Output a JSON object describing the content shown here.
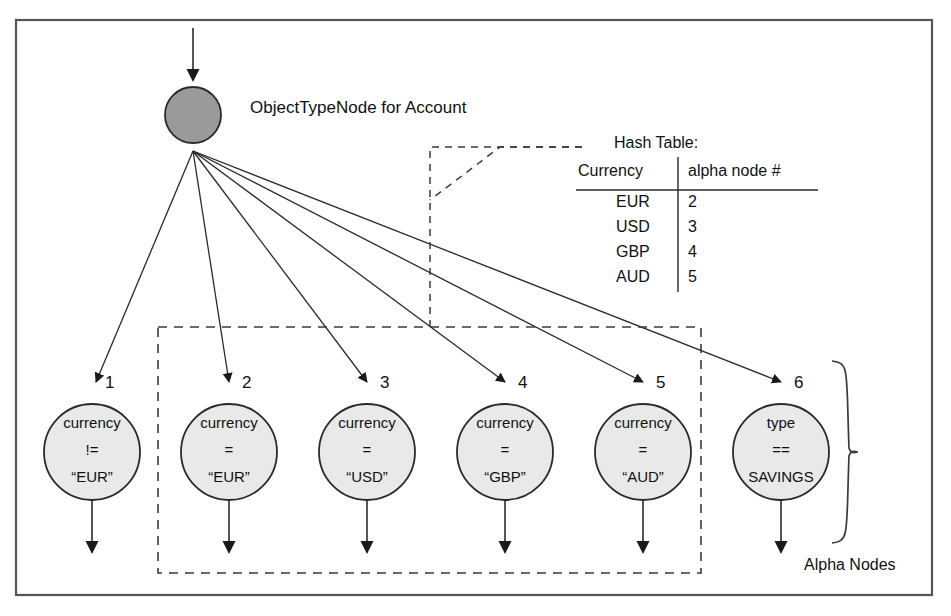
{
  "figure": {
    "title_note": "ObjectTypeNode for Account",
    "root_node": {
      "name": "ObjectTypeNode",
      "label": "ObjectTypeNode for Account",
      "fill": "#9a9a9a"
    }
  },
  "hash_table": {
    "caption": "Hash Table:",
    "columns": [
      "Currency",
      "alpha node #"
    ],
    "rows": [
      {
        "currency": "EUR",
        "node": "2"
      },
      {
        "currency": "USD",
        "node": "3"
      },
      {
        "currency": "GBP",
        "node": "4"
      },
      {
        "currency": "AUD",
        "node": "5"
      }
    ]
  },
  "alpha_nodes": {
    "group_label": "Alpha Nodes",
    "fill": "#e9e9e9",
    "nodes": [
      {
        "number": "1",
        "field": "currency",
        "op": "!=",
        "value": "“EUR”"
      },
      {
        "number": "2",
        "field": "currency",
        "op": "=",
        "value": "“EUR”"
      },
      {
        "number": "3",
        "field": "currency",
        "op": "=",
        "value": "“USD”"
      },
      {
        "number": "4",
        "field": "currency",
        "op": "=",
        "value": "“GBP”"
      },
      {
        "number": "5",
        "field": "currency",
        "op": "=",
        "value": "“AUD”"
      },
      {
        "number": "6",
        "field": "type",
        "op": "==",
        "value": "SAVINGS"
      }
    ]
  },
  "colors": {
    "stroke": "#2a2a2a",
    "border": "#555555",
    "dashed": "#3a3a3a"
  }
}
